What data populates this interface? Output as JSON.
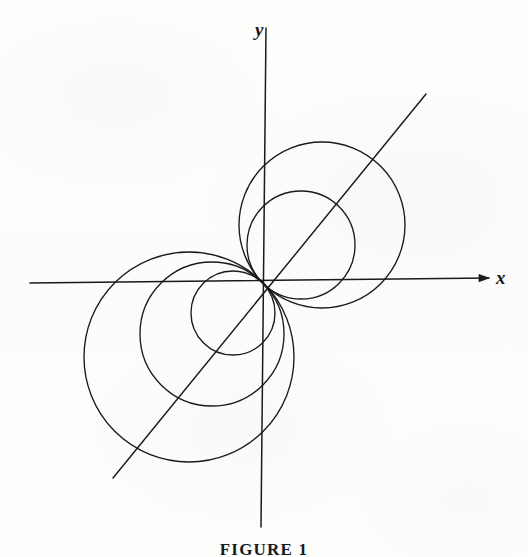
{
  "figure": {
    "caption": "FIGURE 1",
    "background_color": "#fdfdfc",
    "stroke_color": "#1a1a1e"
  },
  "axes": {
    "x_label": "x",
    "y_label": "y",
    "origin_px": [
      263,
      283
    ],
    "x_axis_px": {
      "x1": 30,
      "y1": 283,
      "x2": 487,
      "y2": 278,
      "arrow": true
    },
    "y_axis_px": {
      "x1": 266,
      "y1": 28,
      "x2": 261,
      "y2": 527,
      "arrow": false
    }
  },
  "diagonal_line": {
    "name": "theta-45-degree-line",
    "angle_degrees": 45,
    "x1": 113,
    "y1": 478,
    "x2": 426,
    "y2": 94
  },
  "chart_data": {
    "type": "line",
    "title": "FIGURE 1",
    "xlabel": "x",
    "ylabel": "y",
    "grid": false,
    "legend": null,
    "coordinate_system": "polar",
    "origin_px": [
      263,
      283
    ],
    "axis_angle_degrees": 45,
    "series": [
      {
        "name": "upper-right-large-circle",
        "shape": "circle",
        "quadrant": "upper-right",
        "center_px": [
          322,
          225
        ],
        "radius_px": 83,
        "center_angle_degrees": 45,
        "passes_through_origin": true
      },
      {
        "name": "upper-right-medium-circle",
        "shape": "circle",
        "quadrant": "upper-right",
        "center_px": [
          301,
          245
        ],
        "radius_px": 54,
        "center_angle_degrees": 45,
        "passes_through_origin": true
      },
      {
        "name": "lower-left-large-circle",
        "shape": "circle",
        "quadrant": "lower-left",
        "center_px": [
          189,
          357
        ],
        "radius_px": 105,
        "center_angle_degrees": 225,
        "passes_through_origin": true
      },
      {
        "name": "lower-left-medium-circle",
        "shape": "circle",
        "quadrant": "lower-left",
        "center_px": [
          212,
          334
        ],
        "radius_px": 72,
        "center_angle_degrees": 225,
        "passes_through_origin": true
      },
      {
        "name": "lower-left-small-circle",
        "shape": "circle",
        "quadrant": "lower-left",
        "center_px": [
          233,
          313
        ],
        "radius_px": 42,
        "center_angle_degrees": 225,
        "passes_through_origin": true
      }
    ]
  }
}
